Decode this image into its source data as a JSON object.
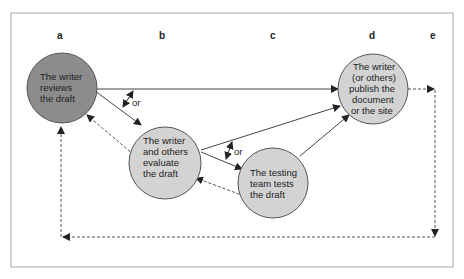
{
  "diagram": {
    "type": "flow",
    "colors": {
      "frame": "#a8a8a8",
      "node_dark": "#8c8c8c",
      "node_light": "#d3d3d3",
      "stroke": "#444444",
      "text": "#222222"
    },
    "columns": [
      {
        "id": "a",
        "label": "a"
      },
      {
        "id": "b",
        "label": "b"
      },
      {
        "id": "c",
        "label": "c"
      },
      {
        "id": "d",
        "label": "d"
      },
      {
        "id": "e",
        "label": "e"
      }
    ],
    "nodes": {
      "review": {
        "lines": [
          "The writer",
          "reviews",
          "the draft"
        ],
        "fill": "dark"
      },
      "evaluate": {
        "lines": [
          "The writer",
          "and others",
          "evaluate",
          "the draft"
        ],
        "fill": "light"
      },
      "test": {
        "lines": [
          "The testing",
          "team tests",
          "the draft"
        ],
        "fill": "light"
      },
      "publish": {
        "lines": [
          "The writer",
          "(or others)",
          "publish the",
          "document",
          "or the site"
        ],
        "fill": "light"
      }
    },
    "choice_labels": {
      "first": "or",
      "second": "or"
    },
    "edges": [
      {
        "from": "review",
        "to": "publish",
        "style": "solid"
      },
      {
        "from": "review",
        "to": "evaluate",
        "style": "solid"
      },
      {
        "from": "evaluate",
        "to": "publish",
        "style": "solid"
      },
      {
        "from": "evaluate",
        "to": "test",
        "style": "solid"
      },
      {
        "from": "test",
        "to": "publish",
        "style": "solid"
      },
      {
        "from": "evaluate",
        "to": "review",
        "style": "dashed"
      },
      {
        "from": "test",
        "to": "evaluate",
        "style": "dashed"
      },
      {
        "from": "publish",
        "to": "column-e",
        "style": "dashed"
      },
      {
        "from": "column-e",
        "to": "review",
        "style": "dashed",
        "via": "bottom loop"
      }
    ]
  }
}
